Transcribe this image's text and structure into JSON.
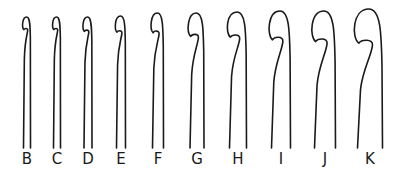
{
  "diagram": {
    "stroke_color": "#1a1a1a",
    "background": "#ffffff",
    "hooks": [
      {
        "label": "B",
        "x": 27,
        "w": 7,
        "head": 7,
        "top": 17
      },
      {
        "label": "C",
        "x": 57,
        "w": 7,
        "head": 7,
        "top": 17
      },
      {
        "label": "D",
        "x": 88,
        "w": 8,
        "head": 8,
        "top": 17
      },
      {
        "label": "E",
        "x": 121,
        "w": 9,
        "head": 9,
        "top": 16
      },
      {
        "label": "F",
        "x": 158,
        "w": 11,
        "head": 11,
        "top": 13
      },
      {
        "label": "G",
        "x": 197,
        "w": 14,
        "head": 13,
        "top": 13
      },
      {
        "label": "H",
        "x": 238,
        "w": 17,
        "head": 14,
        "top": 12
      },
      {
        "label": "I",
        "x": 281,
        "w": 19,
        "head": 16,
        "top": 11
      },
      {
        "label": "J",
        "x": 325,
        "w": 21,
        "head": 17,
        "top": 11
      },
      {
        "label": "K",
        "x": 370,
        "w": 25,
        "head": 19,
        "top": 9
      }
    ]
  }
}
